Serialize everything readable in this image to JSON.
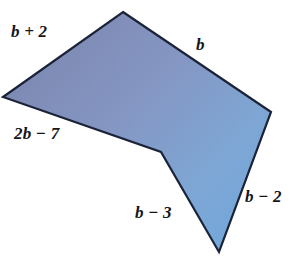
{
  "figure": {
    "background_color": "#ffffff",
    "stroke_color": "#1b2338",
    "stroke_width": 2.2,
    "fill_start_color": "#7b85ad",
    "fill_mid_color": "#8295c2",
    "fill_end_color": "#6fa8dc",
    "label_color": "#15161a",
    "shape": {
      "type": "polygon",
      "sides": 5,
      "concave": true,
      "vertices": [
        {
          "name": "top-apex",
          "x": 123,
          "y": 12
        },
        {
          "name": "right-vertex",
          "x": 271,
          "y": 112
        },
        {
          "name": "bottom-apex",
          "x": 219,
          "y": 252
        },
        {
          "name": "notch-vertex",
          "x": 161,
          "y": 152
        },
        {
          "name": "left-vertex",
          "x": 3,
          "y": 97
        }
      ],
      "points_attr": "123,12 271,112 219,252 161,152 3,97"
    },
    "edges": [
      {
        "name": "upper-left-edge",
        "label": "b + 2",
        "from": "left-vertex",
        "to": "top-apex"
      },
      {
        "name": "upper-right-edge",
        "label": "b",
        "from": "top-apex",
        "to": "right-vertex"
      },
      {
        "name": "right-edge",
        "label": "b − 2",
        "from": "right-vertex",
        "to": "bottom-apex"
      },
      {
        "name": "lower-inner-edge",
        "label": "b − 3",
        "from": "bottom-apex",
        "to": "notch-vertex"
      },
      {
        "name": "lower-left-edge",
        "label": "2b − 7",
        "from": "notch-vertex",
        "to": "left-vertex"
      }
    ],
    "labels": {
      "b_plus_2": "b + 2",
      "b": "b",
      "two_b_minus_7": "2b − 7",
      "b_minus_3": "b − 3",
      "b_minus_2": "b − 2"
    }
  }
}
